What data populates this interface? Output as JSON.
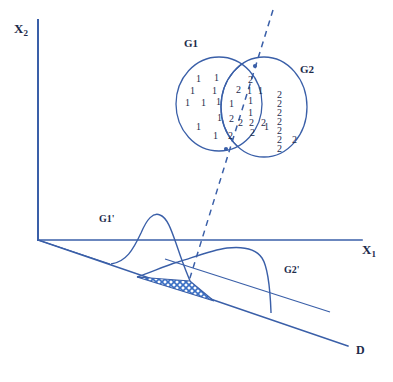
{
  "figure": {
    "colors": {
      "stroke": "#3a5fa8",
      "text": "#1c2b4a",
      "hatch": "#3a6fc4",
      "background": "#ffffff"
    }
  },
  "axes": {
    "y_label": "X",
    "y_sub": "2",
    "x_label": "X",
    "x_sub": "1",
    "projection_label": "D"
  },
  "groups": [
    {
      "id": "g1",
      "label": "G1"
    },
    {
      "id": "g2",
      "label": "G2"
    }
  ],
  "distributions": [
    {
      "id": "g1p",
      "label": "G1'"
    },
    {
      "id": "g2p",
      "label": "G2'"
    }
  ],
  "chart_data": {
    "type": "scatter",
    "xlabel": "X1",
    "ylabel": "X2",
    "grid": false,
    "legend": [
      "G1",
      "G2"
    ],
    "annotations": [
      "G1",
      "G2",
      "G1'",
      "G2'",
      "D"
    ],
    "series": [
      {
        "name": "G1",
        "marker_label": "1",
        "count": 16,
        "points": [
          {
            "label": "1",
            "x": 196,
            "y": 74
          },
          {
            "label": "1",
            "x": 214,
            "y": 73
          },
          {
            "label": "1",
            "x": 190,
            "y": 86
          },
          {
            "label": "1",
            "x": 212,
            "y": 86
          },
          {
            "label": "1",
            "x": 185,
            "y": 98
          },
          {
            "label": "1",
            "x": 201,
            "y": 98
          },
          {
            "label": "1",
            "x": 216,
            "y": 97
          },
          {
            "label": "1",
            "x": 229,
            "y": 99
          },
          {
            "label": "1",
            "x": 217,
            "y": 113
          },
          {
            "label": "1",
            "x": 196,
            "y": 122
          },
          {
            "label": "1",
            "x": 213,
            "y": 131
          },
          {
            "label": "1",
            "x": 247,
            "y": 86
          },
          {
            "label": "1",
            "x": 258,
            "y": 86
          },
          {
            "label": "1",
            "x": 248,
            "y": 96
          },
          {
            "label": "1",
            "x": 248,
            "y": 108
          },
          {
            "label": "1",
            "x": 264,
            "y": 122
          }
        ]
      },
      {
        "name": "G2",
        "marker_label": "2",
        "count": 18,
        "points": [
          {
            "label": "2",
            "x": 236,
            "y": 85
          },
          {
            "label": "2",
            "x": 248,
            "y": 75
          },
          {
            "label": "2",
            "x": 229,
            "y": 114
          },
          {
            "label": "2",
            "x": 228,
            "y": 131
          },
          {
            "label": "2",
            "x": 238,
            "y": 118
          },
          {
            "label": "2",
            "x": 249,
            "y": 118
          },
          {
            "label": "2",
            "x": 261,
            "y": 118
          },
          {
            "label": "2",
            "x": 250,
            "y": 128
          },
          {
            "label": "2",
            "x": 277,
            "y": 90
          },
          {
            "label": "2",
            "x": 277,
            "y": 99
          },
          {
            "label": "2",
            "x": 277,
            "y": 108
          },
          {
            "label": "2",
            "x": 277,
            "y": 117
          },
          {
            "label": "2",
            "x": 277,
            "y": 126
          },
          {
            "label": "2",
            "x": 277,
            "y": 135
          },
          {
            "label": "2",
            "x": 277,
            "y": 144
          },
          {
            "label": "2",
            "x": 292,
            "y": 135
          }
        ]
      }
    ],
    "ellipses": [
      {
        "name": "G1",
        "cx": 219,
        "cy": 104,
        "rx": 43,
        "ry": 47,
        "rotation": 0
      },
      {
        "name": "G2",
        "cx": 264,
        "cy": 107,
        "rx": 43,
        "ry": 50,
        "rotation": 0
      }
    ],
    "decision_boundary": {
      "label": "dashed discriminant line",
      "style": "dashed",
      "from": {
        "x": 273,
        "y": 10
      },
      "to": {
        "x": 189,
        "y": 281
      }
    },
    "projected_densities": [
      {
        "name": "G1'",
        "peak_x": 150,
        "overlap": true
      },
      {
        "name": "G2'",
        "peak_x": 235,
        "overlap": true
      }
    ],
    "overlap_region": {
      "label": "misclassification area",
      "fill": "crosshatch",
      "color": "#3a6fc4"
    }
  }
}
